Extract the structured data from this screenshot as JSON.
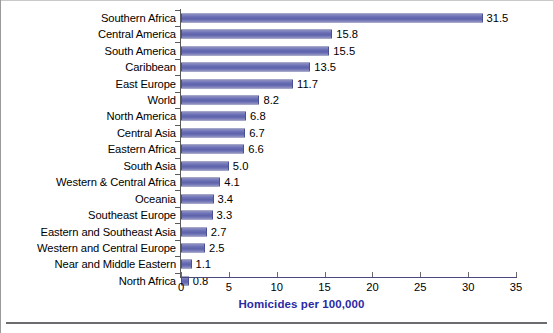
{
  "figure": {
    "axis_title": "Homicides per 100,000",
    "axis_title_color": "#2a2aa5",
    "bar_color": "#6a6fb5",
    "bar_border_color": "#4b4f93",
    "axis_color": "#5a5a5a"
  },
  "chart_data": {
    "type": "bar",
    "orientation": "horizontal",
    "title": "",
    "xlabel": "Homicides per 100,000",
    "ylabel": "",
    "xlim": [
      0,
      35
    ],
    "xticks": [
      0,
      5,
      10,
      15,
      20,
      25,
      30,
      35
    ],
    "grid": false,
    "legend": "none",
    "data_labels": true,
    "categories": [
      "Southern Africa",
      "Central America",
      "South America",
      "Caribbean",
      "East Europe",
      "World",
      "North America",
      "Central Asia",
      "Eastern Africa",
      "South Asia",
      "Western & Central Africa",
      "Oceania",
      "Southeast Europe",
      "Eastern and Southeast Asia",
      "Western and Central Europe",
      "Near and Middle Eastern",
      "North Africa"
    ],
    "values": [
      31.5,
      15.8,
      15.5,
      13.5,
      11.7,
      8.2,
      6.8,
      6.7,
      6.6,
      5.0,
      4.1,
      3.4,
      3.3,
      2.7,
      2.5,
      1.1,
      0.8
    ],
    "value_labels": [
      "31.5",
      "15.8",
      "15.5",
      "13.5",
      "11.7",
      "8.2",
      "6.8",
      "6.7",
      "6.6",
      "5.0",
      "4.1",
      "3.4",
      "3.3",
      "2.7",
      "2.5",
      "1.1",
      "0.8"
    ],
    "xtick_labels": [
      "0",
      "5",
      "10",
      "15",
      "20",
      "25",
      "30",
      "35"
    ]
  }
}
